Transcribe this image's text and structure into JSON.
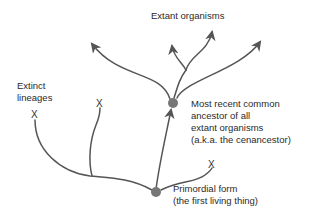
{
  "diagram": {
    "labels": {
      "extant": "Extant organisms",
      "extinct_line1": "Extinct",
      "extinct_line2": "lineages",
      "mrca_line1": "Most recent common",
      "mrca_line2": "ancestor of all",
      "mrca_line3": "extant organisms",
      "mrca_line4": "(a.k.a. the cenancestor)",
      "primordial_line1": "Primordial form",
      "primordial_line2": "(the first living thing)"
    },
    "extinction_marker": "X",
    "colors": {
      "branch": "#555555",
      "node": "#777777",
      "text": "#2a2a2a"
    },
    "nodes": [
      {
        "name": "cenancestor",
        "x": 173,
        "y": 103
      },
      {
        "name": "primordial-form",
        "x": 156,
        "y": 192
      }
    ],
    "extinct_markers": [
      {
        "x": 35,
        "y": 115
      },
      {
        "x": 100,
        "y": 104
      },
      {
        "x": 212,
        "y": 165
      }
    ]
  }
}
